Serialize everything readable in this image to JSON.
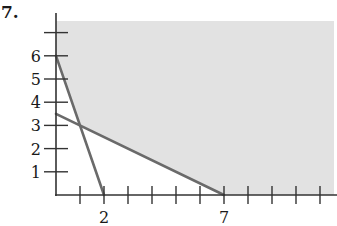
{
  "problem": {
    "number": "7."
  },
  "colors": {
    "shade": "#e2e2e2",
    "axis": "#333333",
    "boundary_line": "#6a6a6a",
    "text": "#1a1a1a"
  },
  "chart_data": {
    "type": "line",
    "title": "",
    "xlabel": "",
    "ylabel": "",
    "xlim": [
      0,
      11
    ],
    "ylim": [
      0,
      7
    ],
    "grid": false,
    "legend": null,
    "x_tick_labels": [
      {
        "value": 2,
        "label": "2"
      },
      {
        "value": 7,
        "label": "7"
      }
    ],
    "x_ticks": [
      1,
      2,
      3,
      4,
      5,
      6,
      7,
      8,
      9,
      10,
      11
    ],
    "y_tick_labels": [
      {
        "value": 1,
        "label": "1"
      },
      {
        "value": 2,
        "label": "2"
      },
      {
        "value": 3,
        "label": "3"
      },
      {
        "value": 4,
        "label": "4"
      },
      {
        "value": 5,
        "label": "5"
      },
      {
        "value": 6,
        "label": "6"
      }
    ],
    "y_ticks": [
      1,
      2,
      3,
      4,
      5,
      6,
      7
    ],
    "series": [
      {
        "name": "line-1",
        "points": [
          [
            0,
            6
          ],
          [
            2,
            0
          ]
        ],
        "equation": "3x + y = 6"
      },
      {
        "name": "line-2",
        "points": [
          [
            0,
            3.5
          ],
          [
            7,
            0
          ]
        ],
        "equation": "x + 2y = 7"
      }
    ],
    "shaded_region": {
      "description": "feasible region above both lines, x >= 0, y >= 0 (unbounded)",
      "vertices": [
        [
          0,
          7.5
        ],
        [
          0,
          6
        ],
        [
          1,
          3
        ],
        [
          7,
          0
        ],
        [
          11.6,
          0
        ],
        [
          11.6,
          7.5
        ]
      ]
    },
    "intersection": [
      1,
      3
    ]
  }
}
